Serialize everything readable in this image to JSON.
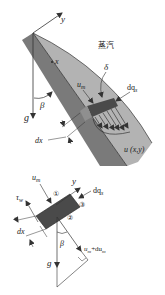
{
  "colors": {
    "wall": "#7a7a7a",
    "film": "#b3b3b3",
    "element": "#4a4a4a",
    "element_light": "#8f8f8f",
    "lines": "#333333",
    "background": "#ffffff"
  },
  "top_figure": {
    "axis_y_label": "y",
    "axis_x_label": "x",
    "gravity_label": "g",
    "angle_label": "β",
    "vapor_label": "蒸汽",
    "film_thickness_label": "δ",
    "mean_velocity_label": "u",
    "mean_velocity_sub": "m",
    "heat_flux_label": "dq",
    "heat_flux_sub": "s",
    "element_width_label": "dx",
    "velocity_profile_label": "u (x,y)"
  },
  "bottom_figure": {
    "mean_velocity_label": "u",
    "mean_velocity_sub": "m",
    "axis_y_label": "y",
    "heat_flux_label": "dq",
    "heat_flux_sub": "s",
    "face_1": "①",
    "face_2": "②",
    "face_3": "③",
    "wall_shear_label": "τ",
    "wall_shear_sub": "w",
    "element_width_label": "dx",
    "angle_label": "β",
    "gravity_label": "g",
    "outflow_velocity_label": "u",
    "outflow_velocity_sub": "m",
    "outflow_velocity_suffix": "+du",
    "outflow_velocity_suffix_sub": "m"
  }
}
